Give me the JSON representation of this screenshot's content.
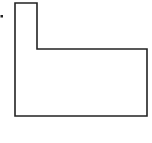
{
  "diagram": {
    "shape": "L-shaped outline (rectilinear polygon)",
    "stroke_color": "#222222",
    "background": "#ffffff",
    "points": "15,3 37,3 37,49 147,49 147,116 15,116",
    "marker": {
      "x": 1.5,
      "y": 16,
      "size": 2
    }
  }
}
